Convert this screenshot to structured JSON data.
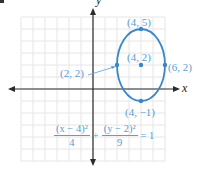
{
  "colors": {
    "curve": "#3a86c6",
    "label": "#5c9dd2",
    "axis": "#2b2b2b",
    "grid": "#e6e6e6"
  },
  "axes": {
    "x_label": "x",
    "y_label": "y",
    "x_range": [
      -6,
      6
    ],
    "y_range": [
      -6,
      6
    ]
  },
  "points": [
    {
      "name": "top-vertex",
      "x": 4,
      "y": 5,
      "label": "(4, 5)"
    },
    {
      "name": "center",
      "x": 4,
      "y": 2,
      "label": "(4, 2)"
    },
    {
      "name": "left-co-vertex",
      "x": 2,
      "y": 2,
      "label": "(2, 2)"
    },
    {
      "name": "right-co-vertex",
      "x": 6,
      "y": 2,
      "label": "(6, 2)"
    },
    {
      "name": "bottom-vertex",
      "x": 4,
      "y": -1,
      "label": "(4, −1)"
    }
  ],
  "ellipse": {
    "center": [
      4,
      2
    ],
    "a_horizontal": 2,
    "b_vertical": 3
  },
  "equation": {
    "term1_num": "(x − 4)²",
    "term1_den": "4",
    "plus": "+",
    "term2_num": "(y − 2)²",
    "term2_den": "9",
    "equals": "= 1"
  }
}
